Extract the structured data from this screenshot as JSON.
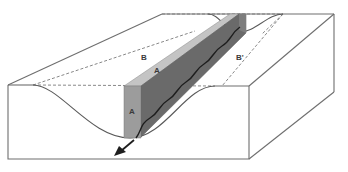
{
  "diagram": {
    "type": "block-diagram",
    "labels": {
      "B": "B",
      "A_top": "A",
      "B_prime": "B'",
      "A_front": "A"
    },
    "colors": {
      "background": "#ffffff",
      "block_edge": "#6e6e6e",
      "plane_top_light": "#c4c4c4",
      "plane_front_medium": "#9c9c9c",
      "plane_side_dark": "#6a6a6a",
      "stream": "#1e1e1e",
      "arrow": "#1e1e1e"
    },
    "elements": [
      "block-outline",
      "valley-profile-front",
      "valley-profile-back",
      "inclined-plane-A",
      "stream-line",
      "flow-direction-arrow",
      "dashed-reference-lines"
    ]
  }
}
